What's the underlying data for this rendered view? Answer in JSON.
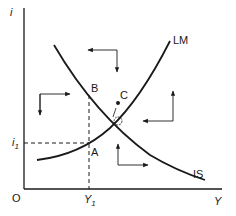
{
  "diagram": {
    "type": "IS-LM",
    "axes": {
      "y_label": "i",
      "x_label": "Y",
      "origin_label": "O"
    },
    "curves": [
      {
        "name": "IS",
        "label": "IS",
        "slope": "downward"
      },
      {
        "name": "LM",
        "label": "LM",
        "slope": "upward"
      }
    ],
    "points": [
      {
        "label": "A"
      },
      {
        "label": "B"
      },
      {
        "label": "C"
      }
    ],
    "ticks": {
      "i1_label": "i",
      "i1_sub": "1",
      "Y1_label": "Y",
      "Y1_sub": "1"
    },
    "colors": {
      "ink": "#1a1a1a",
      "background": "#ffffff"
    }
  }
}
